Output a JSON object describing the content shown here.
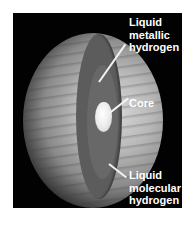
{
  "diagram": {
    "labels": [
      {
        "id": "liquid-metallic-hydrogen",
        "text": "Liquid\nmetallic\nhydrogen"
      },
      {
        "id": "core",
        "text": "Core"
      },
      {
        "id": "liquid-molecular-hydrogen",
        "text": "Liquid\nmolecular\nhydrogen"
      }
    ]
  },
  "colors": {
    "background": "#020202",
    "outer_layer": "#5c5c5c",
    "inner_layer": "#686868",
    "core": "#ececec",
    "label_text": "#ffffff"
  }
}
